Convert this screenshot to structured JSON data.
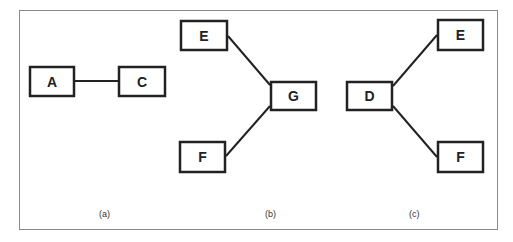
{
  "diagrams": [
    {
      "id": "a",
      "caption": "(a)",
      "nodes": [
        {
          "label": "A",
          "x": 29,
          "y": 66,
          "w": 46,
          "h": 31
        },
        {
          "label": "C",
          "x": 118,
          "y": 66,
          "w": 48,
          "h": 31
        }
      ],
      "edges": [
        {
          "from": "A",
          "to": "C",
          "x1": 75,
          "y1": 81,
          "x2": 118,
          "y2": 81
        }
      ]
    },
    {
      "id": "b",
      "caption": "(b)",
      "nodes": [
        {
          "label": "E",
          "x": 180,
          "y": 20,
          "w": 48,
          "h": 31
        },
        {
          "label": "G",
          "x": 270,
          "y": 81,
          "w": 47,
          "h": 30
        },
        {
          "label": "F",
          "x": 179,
          "y": 141,
          "w": 47,
          "h": 32
        }
      ],
      "edges": [
        {
          "from": "E",
          "to": "G",
          "x1": 228,
          "y1": 36,
          "x2": 270,
          "y2": 85
        },
        {
          "from": "F",
          "to": "G",
          "x1": 226,
          "y1": 156,
          "x2": 270,
          "y2": 106
        }
      ]
    },
    {
      "id": "c",
      "caption": "(c)",
      "nodes": [
        {
          "label": "D",
          "x": 346,
          "y": 81,
          "w": 47,
          "h": 30
        },
        {
          "label": "E",
          "x": 437,
          "y": 19,
          "w": 47,
          "h": 32
        },
        {
          "label": "F",
          "x": 437,
          "y": 141,
          "w": 47,
          "h": 32
        }
      ],
      "edges": [
        {
          "from": "D",
          "to": "E",
          "x1": 393,
          "y1": 86,
          "x2": 437,
          "y2": 35
        },
        {
          "from": "D",
          "to": "F",
          "x1": 393,
          "y1": 106,
          "x2": 437,
          "y2": 157
        }
      ]
    }
  ],
  "captions": {
    "a": {
      "text": "(a)",
      "x": 99,
      "y": 217
    },
    "b": {
      "text": "(b)",
      "x": 265,
      "y": 217
    },
    "c": {
      "text": "(c)",
      "x": 409,
      "y": 217
    }
  },
  "colors": {
    "stroke": "#222222",
    "frame": "#8a8a8a",
    "background": "#ffffff"
  }
}
